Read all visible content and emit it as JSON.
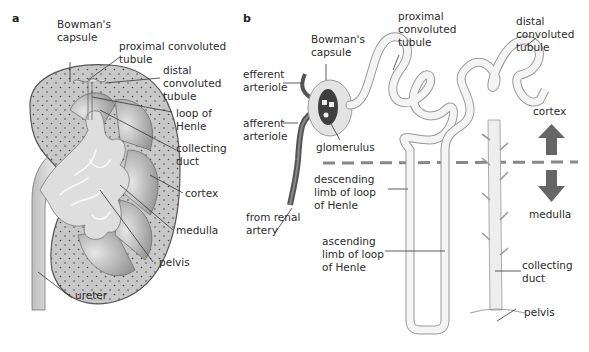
{
  "figure": {
    "panel_a": {
      "letter": "a",
      "title": "Kidney section",
      "labels": {
        "bowmans_capsule_1": "Bowman's",
        "bowmans_capsule_2": "capsule",
        "pct_1": "proximal convoluted",
        "pct_2": "tubule",
        "dct_1": "distal",
        "dct_2": "convoluted",
        "dct_3": "tubule",
        "loop_1": "loop of",
        "loop_2": "Henle",
        "cd_1": "collecting",
        "cd_2": "duct",
        "cortex": "cortex",
        "medulla": "medulla",
        "pelvis": "pelvis",
        "ureter": "ureter"
      }
    },
    "panel_b": {
      "letter": "b",
      "title": "Nephron",
      "labels": {
        "bowmans_1": "Bowman's",
        "bowmans_2": "capsule",
        "pct_1": "proximal",
        "pct_2": "convoluted",
        "pct_3": "tubule",
        "dct_1": "distal",
        "dct_2": "convoluted",
        "dct_3": "tubule",
        "efferent_1": "efferent",
        "efferent_2": "arteriole",
        "afferent_1": "afferent",
        "afferent_2": "arteriole",
        "glomerulus": "glomerulus",
        "renal_1": "from renal",
        "renal_2": "artery",
        "desc_1": "descending",
        "desc_2": "limb of loop",
        "desc_3": "of Henle",
        "asc_1": "ascending",
        "asc_2": "limb of loop",
        "asc_3": "of Henle",
        "cortex": "cortex",
        "medulla": "medulla",
        "cd_1": "collecting",
        "cd_2": "duct",
        "pelvis": "pelvis"
      }
    },
    "colors": {
      "cortex_fill": "#c9c9c9",
      "medulla_fill": "#a9a9a9",
      "pelvis_fill": "#dcdcdc",
      "tubule_fill": "#eeeeee",
      "arrow": "#666666",
      "arteriole": "#555555"
    }
  }
}
